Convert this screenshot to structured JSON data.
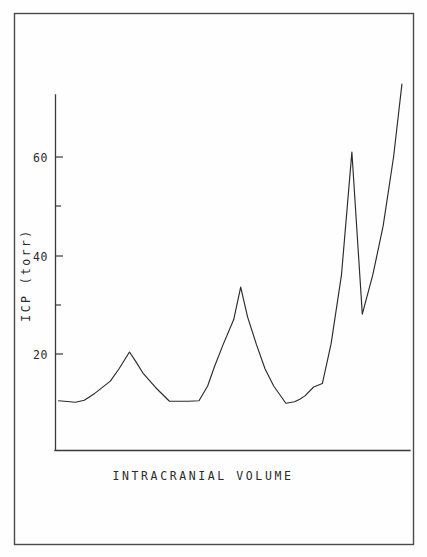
{
  "figure": {
    "background_color": "#fefefe",
    "frame_color": "#4a4a4a",
    "line_color": "#2b2b2b",
    "xlabel_text": "INTRACRANIAL VOLUME",
    "ylabel_text": "ICP (torr)"
  },
  "axis": {
    "y_tick_labels": [
      "20",
      "40",
      "60"
    ],
    "y_tick_values": [
      20,
      40,
      60
    ],
    "y_minor_tick_values": [
      30,
      50
    ],
    "y_axis_top_value": 76,
    "y_axis_bottom_value": 0.5
  },
  "chart_data": {
    "type": "line",
    "title": "",
    "xlabel": "INTRACRANIAL VOLUME",
    "ylabel": "ICP (torr)",
    "xlim": [
      0,
      100
    ],
    "ylim": [
      0.5,
      76
    ],
    "grid": false,
    "legend": null,
    "x_axis_ticks_shown": false,
    "y_axis_ticks": [
      20,
      40,
      60
    ],
    "y_axis_minor_ticks": [
      30,
      50
    ],
    "series": [
      {
        "name": "ICP",
        "x": [
          0.6,
          5.5,
          8.0,
          11.0,
          15.5,
          18.0,
          21.0,
          22.8,
          25.0,
          28.5,
          32.5,
          36.0,
          38.0,
          41.0,
          43.5,
          45.5,
          48.0,
          51.0,
          53.0,
          55.0,
          57.5,
          60.0,
          62.5,
          66.0,
          68.5,
          70.0,
          71.5,
          74.0,
          76.5,
          79.0,
          82.0,
          85.0,
          88.0,
          91.0,
          94.0,
          97.0,
          99.4
        ],
        "y": [
          10.5,
          10.2,
          10.6,
          12.0,
          14.5,
          17.0,
          20.4,
          18.5,
          16.0,
          13.2,
          10.4,
          10.4,
          10.4,
          10.5,
          13.5,
          17.5,
          22.0,
          27.0,
          33.6,
          27.5,
          22.0,
          17.0,
          13.5,
          10.0,
          10.3,
          10.8,
          11.5,
          13.3,
          14.0,
          22.0,
          36.0,
          61.0,
          28.1,
          36.0,
          46.0,
          60.0,
          74.8
        ]
      }
    ],
    "annotations": [
      {
        "label": "first peak",
        "value": 20.4
      },
      {
        "label": "second peak",
        "value": 33.6
      },
      {
        "label": "third peak",
        "value": 61.0
      },
      {
        "label": "post-peak valley",
        "value": 28.1
      },
      {
        "label": "terminal value",
        "value": 74.8
      },
      {
        "label": "baseline plateau",
        "value": 10.4
      }
    ]
  }
}
